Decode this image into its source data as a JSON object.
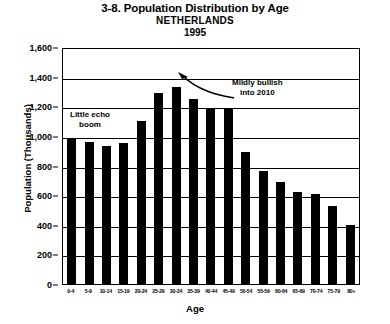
{
  "title": {
    "main": "3-8. Population Distribution by Age",
    "country": "NETHERLANDS",
    "year": "1995"
  },
  "axes": {
    "ylabel": "Population (Thousands)",
    "xlabel": "Age"
  },
  "annotations": {
    "echo": "Little echo\nboom",
    "bullish": "Mildly bullish\ninto 2010"
  },
  "chart_data": {
    "type": "bar",
    "title": "3-8. Population Distribution by Age NETHERLANDS 1995",
    "subtitle": "NETHERLANDS 1995",
    "xlabel": "Age",
    "ylabel": "Population (Thousands)",
    "ylim": [
      0,
      1600
    ],
    "yticks": [
      "0",
      "200",
      "400",
      "600",
      "800",
      "1,000",
      "1,200",
      "1,400",
      "1,600"
    ],
    "ytick_values": [
      0,
      200,
      400,
      600,
      800,
      1000,
      1200,
      1400,
      1600
    ],
    "grid": true,
    "legend": "none",
    "bar_color": "#000000",
    "categories": [
      "0-4",
      "5-9",
      "10-14",
      "15-19",
      "20-24",
      "25-29",
      "30-34",
      "35-39",
      "40-44",
      "45-49",
      "50-54",
      "55-59",
      "60-64",
      "65-69",
      "70-74",
      "75-79",
      "80+"
    ],
    "values": [
      980,
      960,
      930,
      950,
      1100,
      1290,
      1330,
      1250,
      1190,
      1190,
      890,
      765,
      690,
      620,
      610,
      530,
      400
    ],
    "annotations": [
      {
        "text": "Little echo boom",
        "target": "0-4"
      },
      {
        "text": "Mildly bullish into 2010",
        "target": "30-34",
        "arrow": true
      }
    ]
  }
}
